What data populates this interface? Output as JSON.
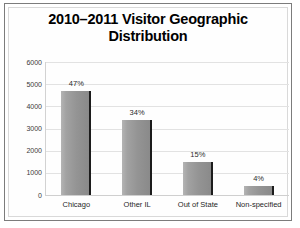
{
  "chart_data": {
    "type": "bar",
    "title": "2010–2011 Visitor Geographic Distribution",
    "title_lines": [
      "2010–2011 Visitor Geographic",
      "Distribution"
    ],
    "categories": [
      "Chicago",
      "Other IL",
      "Out of State",
      "Non-specified"
    ],
    "values": [
      4700,
      3400,
      1500,
      400
    ],
    "data_labels": [
      "47%",
      "34%",
      "15%",
      "4%"
    ],
    "xlabel": "",
    "ylabel": "",
    "ylim": [
      0,
      6000
    ],
    "yticks": [
      6000,
      5000,
      4000,
      3000,
      2000,
      1000,
      0
    ],
    "ytick_labels": [
      "6000",
      "5000",
      "4000",
      "3000",
      "2000",
      "1000",
      "0"
    ],
    "grid": true,
    "legend": false,
    "series": [
      {
        "name": "Visitors",
        "values": [
          4700,
          3400,
          1500,
          400
        ]
      }
    ],
    "colors": {
      "bar_fill": "#949494",
      "bar_edge": "#1c1c1c",
      "gridline": "#e2e2e2",
      "axis": "#d2d2d2",
      "text": "#1e1e1e",
      "frame": "#7c7c7c",
      "background": "#ffffff"
    }
  }
}
